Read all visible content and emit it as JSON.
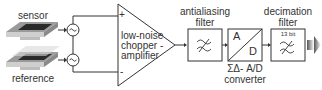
{
  "diagram": {
    "inputs": [
      {
        "label": "sensor"
      },
      {
        "label": "reference"
      }
    ],
    "sources": [
      {
        "symbol": "~",
        "icon": "ac-source-icon"
      },
      {
        "symbol": "~",
        "icon": "ac-source-icon"
      }
    ],
    "amplifier": {
      "label_lines": [
        "low-noise",
        "chopper -",
        "amplifier"
      ],
      "plus": "+",
      "minus": "-"
    },
    "antialiasing_filter": {
      "label_lines": [
        "antialiasing",
        "filter"
      ],
      "icon": "lowpass-filter-icon"
    },
    "adc": {
      "top": "A",
      "bottom": "D",
      "caption_lines": [
        "ΣΔ- A/D",
        "converter"
      ]
    },
    "decimation_filter": {
      "label_lines": [
        "decimation",
        "filter"
      ],
      "bits": "13 bit",
      "icon": "lowpass-filter-icon"
    },
    "output": {
      "icon": "output-arrow-icon"
    },
    "colors": {
      "line": "#333333",
      "text": "#333333",
      "chip_dark": "#2a2a2a",
      "chip_light": "#bdbdbd"
    }
  }
}
